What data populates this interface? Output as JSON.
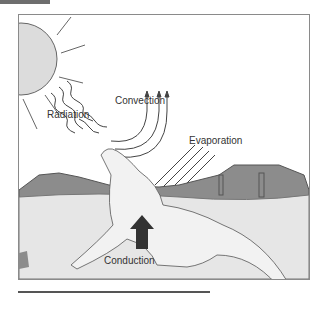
{
  "figure": {
    "labels": {
      "radiation": "Radiation",
      "convection": "Convection",
      "evaporation": "Evaporation",
      "conduction": "Conduction"
    },
    "colors": {
      "sun_fill": "#dcdcdc",
      "ground_fill": "#e6e6e6",
      "hills_fill": "#8c8c8c",
      "arrow_dark": "#333333",
      "line": "#555555",
      "border": "#8a8a8a"
    }
  }
}
